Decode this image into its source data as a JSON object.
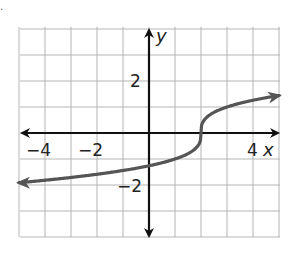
{
  "page": {
    "corner_mark": "."
  },
  "chart_data": {
    "type": "line",
    "title": "",
    "function": "y = cbrt(x - 2)",
    "xlabel": "x",
    "ylabel": "y",
    "xlim": [
      -5,
      5
    ],
    "ylim": [
      -4,
      4
    ],
    "grid": true,
    "grid_step": 1,
    "x_ticks_labeled": [
      {
        "value": -4,
        "label": "−4"
      },
      {
        "value": -2,
        "label": "−2"
      },
      {
        "value": 4,
        "label": "4"
      }
    ],
    "y_ticks_labeled": [
      {
        "value": 2,
        "label": "2"
      },
      {
        "value": -2,
        "label": "−2"
      }
    ],
    "series": [
      {
        "name": "curve",
        "color": "#555555",
        "arrows": "both",
        "points": [
          [
            -5,
            -1.91
          ],
          [
            -4,
            -1.82
          ],
          [
            -3,
            -1.71
          ],
          [
            -2,
            -1.59
          ],
          [
            -1,
            -1.44
          ],
          [
            0,
            -1.26
          ],
          [
            1,
            -1.0
          ],
          [
            1.5,
            -0.79
          ],
          [
            1.9,
            -0.46
          ],
          [
            2,
            0
          ],
          [
            2.1,
            0.46
          ],
          [
            2.5,
            0.79
          ],
          [
            3,
            1.0
          ],
          [
            4,
            1.26
          ],
          [
            5,
            1.44
          ]
        ]
      }
    ],
    "colors": {
      "axis": "#111111",
      "grid": "#b5b5b5",
      "curve": "#555555"
    }
  }
}
